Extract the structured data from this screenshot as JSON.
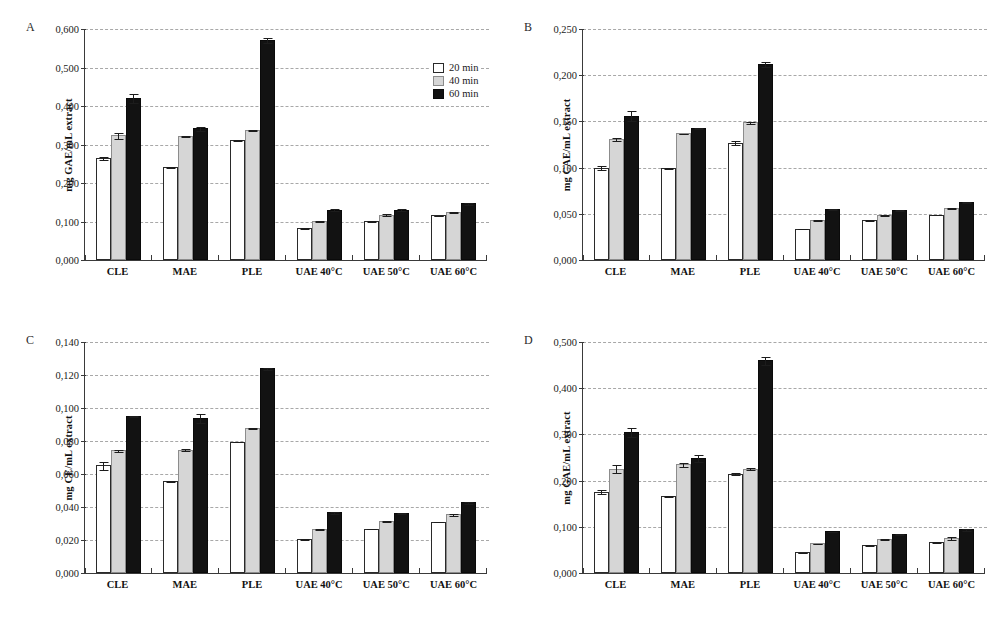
{
  "figure": {
    "panels": [
      "A",
      "B",
      "C",
      "D"
    ],
    "legend": {
      "items": [
        {
          "label": "20 min",
          "color": "#ffffff",
          "key": "s20"
        },
        {
          "label": "40 min",
          "color": "#d6d6d6",
          "key": "s40"
        },
        {
          "label": "60 min",
          "color": "#121212",
          "key": "s60"
        }
      ]
    }
  },
  "chart_data": [
    {
      "type": "bar",
      "panel": "A",
      "title": "",
      "xlabel": "",
      "ylabel": "mg GAE/mL extract",
      "ylim": [
        0,
        0.6
      ],
      "ytick_step": 0.1,
      "ytick_labels": [
        "0,000",
        "0,100",
        "0,200",
        "0,300",
        "0,400",
        "0,500",
        "0,600"
      ],
      "grid": true,
      "legend_position": "top-right",
      "categories": [
        "CLE",
        "MAE",
        "PLE",
        "UAE 40°C",
        "UAE 50°C",
        "UAE 60°C"
      ],
      "series": [
        {
          "name": "20 min",
          "values": [
            0.265,
            0.241,
            0.312,
            0.083,
            0.101,
            0.116
          ],
          "errors": [
            0.004,
            0.002,
            0.003,
            0.002,
            0.002,
            0.002
          ]
        },
        {
          "name": "40 min",
          "values": [
            0.324,
            0.323,
            0.337,
            0.102,
            0.118,
            0.125
          ],
          "errors": [
            0.009,
            0.003,
            0.003,
            0.002,
            0.003,
            0.002
          ]
        },
        {
          "name": "60 min",
          "values": [
            0.421,
            0.342,
            0.571,
            0.131,
            0.131,
            0.147
          ],
          "errors": [
            0.013,
            0.007,
            0.008,
            0.003,
            0.003,
            0.003
          ]
        }
      ]
    },
    {
      "type": "bar",
      "panel": "B",
      "title": "",
      "xlabel": "",
      "ylabel": "mg CAE/mL extract",
      "ylim": [
        0,
        0.25
      ],
      "ytick_step": 0.05,
      "ytick_labels": [
        "0,000",
        "0,050",
        "0,100",
        "0,150",
        "0,200",
        "0,250"
      ],
      "grid": true,
      "legend_position": "none",
      "categories": [
        "CLE",
        "MAE",
        "PLE",
        "UAE 40°C",
        "UAE 50°C",
        "UAE 60°C"
      ],
      "series": [
        {
          "name": "20 min",
          "values": [
            0.1,
            0.0995,
            0.127,
            0.034,
            0.0435,
            0.049
          ],
          "errors": [
            0.0025,
            0.0008,
            0.0025,
            0.0006,
            0.0008,
            0.0006
          ]
        },
        {
          "name": "40 min",
          "values": [
            0.131,
            0.137,
            0.149,
            0.0435,
            0.0485,
            0.056
          ],
          "errors": [
            0.002,
            0.0008,
            0.0015,
            0.0012,
            0.0008,
            0.001
          ]
        },
        {
          "name": "60 min",
          "values": [
            0.156,
            0.143,
            0.212,
            0.055,
            0.0545,
            0.0625
          ],
          "errors": [
            0.006,
            0.0015,
            0.003,
            0.0012,
            0.0012,
            0.0012
          ]
        }
      ]
    },
    {
      "type": "bar",
      "panel": "C",
      "title": "",
      "xlabel": "",
      "ylabel": "mg CE/mL extract",
      "ylim": [
        0,
        0.14
      ],
      "ytick_step": 0.02,
      "ytick_labels": [
        "0,000",
        "0,020",
        "0,040",
        "0,060",
        "0,080",
        "0,100",
        "0,120",
        "0,140"
      ],
      "grid": true,
      "legend_position": "none",
      "categories": [
        "CLE",
        "MAE",
        "PLE",
        "UAE 40°C",
        "UAE 50°C",
        "UAE 60°C"
      ],
      "series": [
        {
          "name": "20 min",
          "values": [
            0.0652,
            0.0558,
            0.0797,
            0.0208,
            0.0268,
            0.031
          ],
          "errors": [
            0.0025,
            0.0006,
            0.0004,
            0.0005,
            0.0004,
            0.0003
          ]
        },
        {
          "name": "40 min",
          "values": [
            0.0743,
            0.0748,
            0.088,
            0.0265,
            0.0315,
            0.0355
          ],
          "errors": [
            0.001,
            0.001,
            0.0008,
            0.0006,
            0.0006,
            0.001
          ]
        },
        {
          "name": "60 min",
          "values": [
            0.0952,
            0.094,
            0.124,
            0.0368,
            0.0365,
            0.0428
          ],
          "errors": [
            0.0006,
            0.003,
            0.001,
            0.0008,
            0.0005,
            0.0008
          ]
        }
      ]
    },
    {
      "type": "bar",
      "panel": "D",
      "title": "",
      "xlabel": "",
      "ylabel": "mg GAE/mL extract",
      "ylim": [
        0,
        0.5
      ],
      "ytick_step": 0.1,
      "ytick_labels": [
        "0,000",
        "0,100",
        "0,200",
        "0,300",
        "0,400",
        "0,500"
      ],
      "grid": true,
      "legend_position": "none",
      "categories": [
        "CLE",
        "MAE",
        "PLE",
        "UAE 40°C",
        "UAE 50°C",
        "UAE 60°C"
      ],
      "series": [
        {
          "name": "20 min",
          "values": [
            0.176,
            0.166,
            0.215,
            0.0445,
            0.06,
            0.067
          ],
          "errors": [
            0.005,
            0.002,
            0.003,
            0.002,
            0.002,
            0.002
          ]
        },
        {
          "name": "40 min",
          "values": [
            0.226,
            0.235,
            0.226,
            0.064,
            0.0735,
            0.0755
          ],
          "errors": [
            0.009,
            0.005,
            0.004,
            0.002,
            0.002,
            0.004
          ]
        },
        {
          "name": "60 min",
          "values": [
            0.306,
            0.249,
            0.46,
            0.09,
            0.085,
            0.095
          ],
          "errors": [
            0.011,
            0.008,
            0.01,
            0.002,
            0.002,
            0.003
          ]
        }
      ]
    }
  ]
}
